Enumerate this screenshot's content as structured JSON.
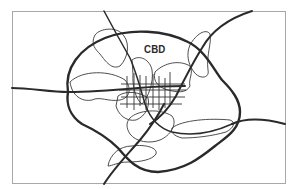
{
  "diagram": {
    "type": "urban-structure-schematic",
    "labels": {
      "cbd": "CBD"
    },
    "colors": {
      "background": "#ffffff",
      "frame": "#a8a8a8",
      "ring_road": "#2a2a2a",
      "radial_road": "#2a2a2a",
      "districts": "#3a3a3a",
      "street_grid": "#333333"
    },
    "elements": [
      {
        "name": "outer-frame",
        "kind": "rectangle"
      },
      {
        "name": "ring-road",
        "kind": "closed-loop",
        "weight": "thick"
      },
      {
        "name": "radial-road-west",
        "kind": "curve",
        "weight": "thick"
      },
      {
        "name": "radial-road-east",
        "kind": "curve",
        "weight": "thick"
      },
      {
        "name": "radial-road-northeast",
        "kind": "curve",
        "weight": "thick"
      },
      {
        "name": "radial-road-north",
        "kind": "curve",
        "weight": "medium"
      },
      {
        "name": "radial-road-southwest",
        "kind": "curve",
        "weight": "thick"
      },
      {
        "name": "district-blobs",
        "kind": "irregular-shapes",
        "weight": "thin",
        "count": 9
      },
      {
        "name": "central-street-grid",
        "kind": "grid",
        "vertical_lines": 7,
        "horizontal_lines": 4
      }
    ]
  }
}
